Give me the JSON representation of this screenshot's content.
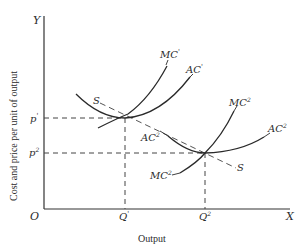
{
  "diagram": {
    "type": "economics-cost-curves",
    "axes": {
      "y_axis_letter": "Y",
      "x_axis_letter": "X",
      "origin": "O",
      "y_label": "Cost and price per unit of output",
      "x_label": "Output"
    },
    "price_levels": [
      {
        "label": "p",
        "superscript": "'"
      },
      {
        "label": "p",
        "superscript": "2"
      }
    ],
    "quantity_levels": [
      {
        "label": "Q",
        "superscript": "'"
      },
      {
        "label": "Q",
        "superscript": "2"
      }
    ],
    "curves": {
      "mc1": {
        "label": "MC",
        "superscript": "'"
      },
      "ac1": {
        "label": "AC",
        "superscript": "'"
      },
      "mc2_upper": {
        "label": "MC",
        "superscript": "2"
      },
      "ac2_upper": {
        "label": "AC",
        "superscript": "2"
      },
      "ac2_lower": {
        "label": "AC",
        "superscript": "2"
      },
      "mc2_lower": {
        "label": "MC",
        "superscript": "2"
      },
      "s_left": {
        "label": "S"
      },
      "s_right": {
        "label": "S"
      }
    }
  }
}
